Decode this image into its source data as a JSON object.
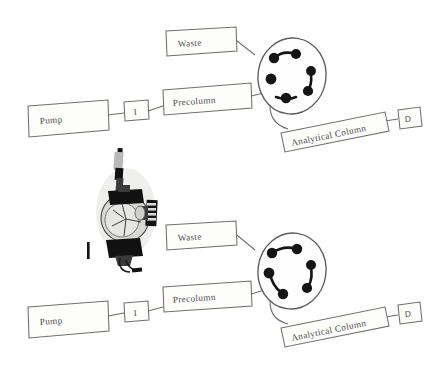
{
  "figure": {
    "type": "schematic-diagram",
    "background_color": "#ffffff",
    "ink_color": "#6f6e6b",
    "port_color": "#141414",
    "panel_count": 2
  },
  "panels": [
    {
      "id": "top-panel",
      "name": "load-position-panel",
      "valve_state": "position-1",
      "nodes": {
        "pump": "Pump",
        "injector": "I",
        "precolumn": "Precolumn",
        "waste": "Waste",
        "analytical_column": "Analytical Column",
        "detector": "D"
      },
      "valve": {
        "name": "six-port-switching-valve",
        "port_count": 6,
        "rotor_connections": [
          [
            1,
            2
          ],
          [
            3,
            4
          ],
          [
            5,
            6
          ]
        ],
        "external_lines": [
          "waste",
          "precolumn",
          "analytical-column"
        ]
      }
    },
    {
      "id": "bottom-panel",
      "name": "inject-position-panel",
      "valve_state": "position-2",
      "nodes": {
        "pump": "Pump",
        "injector": "I",
        "precolumn": "Precolumn",
        "waste": "Waste",
        "analytical_column": "Analytical Column",
        "detector": "D"
      },
      "valve": {
        "name": "six-port-switching-valve",
        "port_count": 6,
        "rotor_connections": [
          [
            6,
            1
          ],
          [
            2,
            3
          ],
          [
            4,
            5
          ]
        ],
        "external_lines": [
          "waste",
          "precolumn",
          "analytical-column"
        ]
      },
      "photo_inset": {
        "name": "valve-photograph",
        "description": "photograph of a physical switching valve with capillary fittings",
        "marker": "I"
      }
    }
  ]
}
